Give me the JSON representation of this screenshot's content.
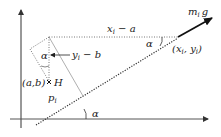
{
  "diagram": {
    "labels": {
      "force": "m",
      "force_sub": "i",
      "force_g": "g",
      "point_xi": "(x",
      "point_xi_sub": "i",
      "point_sep": ", y",
      "point_yi_sub": "i",
      "point_close": ")",
      "dx_x": "x",
      "dx_sub": "i",
      "dx_rest": " − a",
      "dy_y": "y",
      "dy_sub": "i",
      "dy_rest": " − b",
      "ab": "(a,b)",
      "H": "H",
      "p": "p",
      "p_sub": "i",
      "alpha_top_left": "α",
      "alpha_top_right": "α",
      "alpha_bottom": "α"
    },
    "colors": {
      "axis": "#333333",
      "dotted": "#333333",
      "thin_line": "#999999",
      "force_arrow": "#111111"
    }
  }
}
